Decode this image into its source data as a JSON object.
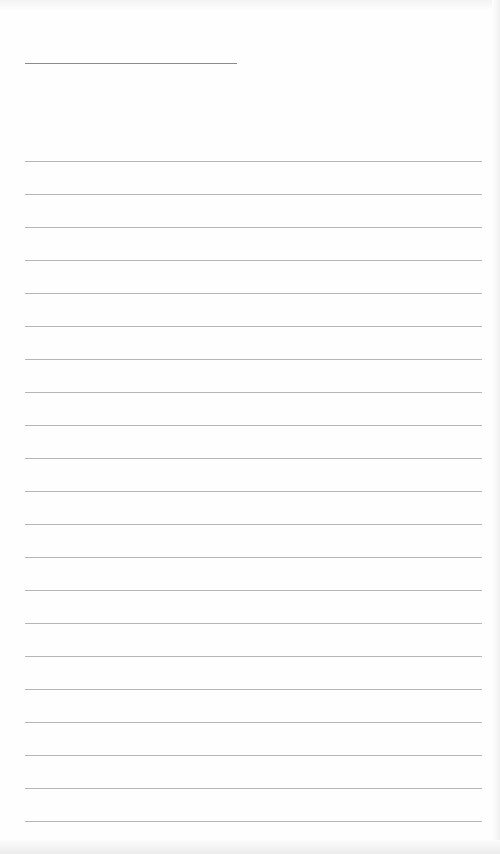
{
  "document": {
    "type": "lined-paper",
    "title_line": {
      "text": "",
      "x": 25,
      "y": 63,
      "width": 212
    },
    "ruled_lines": {
      "count": 21,
      "start_y": 161,
      "spacing": 33,
      "x": 25,
      "width": 457,
      "entries": [
        "",
        "",
        "",
        "",
        "",
        "",
        "",
        "",
        "",
        "",
        "",
        "",
        "",
        "",
        "",
        "",
        "",
        "",
        "",
        "",
        ""
      ]
    },
    "colors": {
      "paper": "#fefefe",
      "line": "#a9a9a9",
      "title_line": "#8c8c8c"
    }
  }
}
